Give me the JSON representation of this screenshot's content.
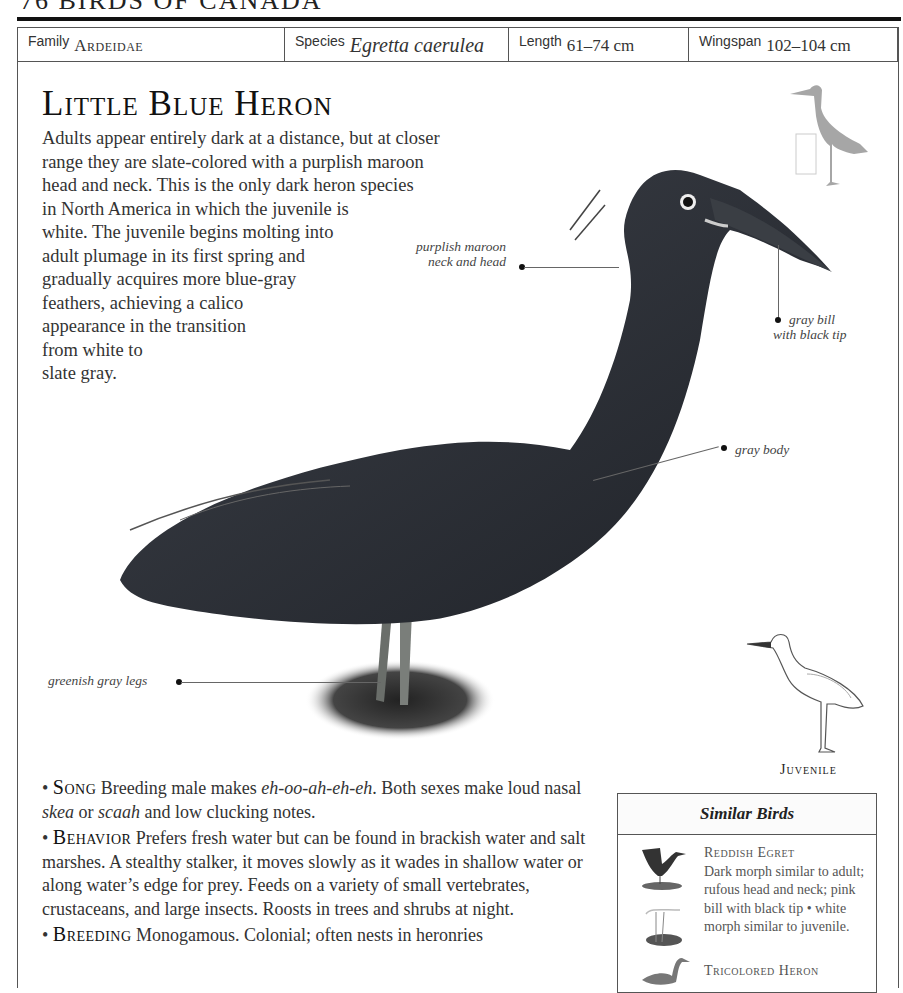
{
  "running_head": "76   BIRDS OF CANADA",
  "header": {
    "family": {
      "label": "Family",
      "value": "Ardeidae"
    },
    "species": {
      "label": "Species",
      "value": "Egretta caerulea"
    },
    "length": {
      "label": "Length",
      "value": "61–74 cm"
    },
    "wingspan": {
      "label": "Wingspan",
      "value": "102–104 cm"
    }
  },
  "title": "Little Blue Heron",
  "intro_lines": [
    "Adults appear entirely dark at a distance, but at closer",
    "range they are slate-colored with a purplish maroon",
    "head and neck. This is the only dark heron species",
    "in North America in which the juvenile is",
    "white. The juvenile begins molting into",
    "adult plumage in its first spring and",
    "gradually acquires more blue-gray",
    "feathers, achieving a calico",
    "appearance in the transition",
    "from white to",
    "slate gray."
  ],
  "annotations": {
    "neck": [
      "purplish maroon",
      "neck and head"
    ],
    "bill": [
      "gray bill",
      "with black tip"
    ],
    "body": "gray body",
    "legs": "greenish gray legs"
  },
  "juvenile_caption": "Juvenile",
  "sections": {
    "song": {
      "heading": "Song",
      "text_a": " Breeding male makes ",
      "call1": "eh-oo-ah-eh-eh",
      "text_b": ". Both sexes make loud nasal ",
      "call2": "skea",
      "text_c": " or ",
      "call3": "scaah",
      "text_d": " and low clucking notes."
    },
    "behavior": {
      "heading": "Behavior",
      "text": " Prefers fresh water but can be found in brackish water and salt marshes. A stealthy stalker, it moves slowly as it wades in shallow water or along water’s edge for prey. Feeds on a variety of small vertebrates, crustaceans, and large insects. Roosts in trees and shrubs at night."
    },
    "breeding": {
      "heading": "Breeding",
      "text": " Monogamous. Colonial; often nests in heronries"
    }
  },
  "similar_birds": {
    "title": "Similar Birds",
    "items": [
      {
        "name": "Reddish Egret",
        "desc": "Dark morph similar to adult; rufous head and neck; pink bill with black tip • white morph similar to juvenile."
      },
      {
        "name": "Tricolored Heron",
        "desc": ""
      }
    ]
  },
  "colors": {
    "rule": "#111111",
    "frame": "#555555",
    "silhouette": "#a6a6a6",
    "bird_dark": "#2b2f36"
  }
}
